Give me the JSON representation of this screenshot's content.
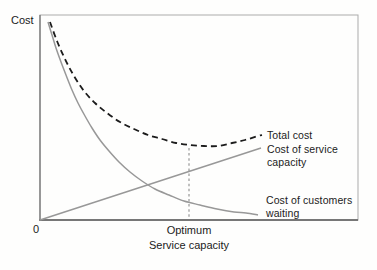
{
  "chart_data": {
    "type": "line",
    "title": "",
    "xlabel": "Service capacity",
    "ylabel": "Cost",
    "origin_tick_label": "0",
    "optimum_tick_label": "Optimum",
    "grid": false,
    "legend_position": "inline-right-labels",
    "note": "Conceptual queuing-cost diagram; no numeric scale shown. Points are in figure pixel coordinates.",
    "frame_px": {
      "x0": 40,
      "y0": 15,
      "x1": 358,
      "y1": 220
    },
    "colors": {
      "frame": "#ababab",
      "axis": "#777777",
      "solid_curve": "#989898",
      "dashed_curve": "#1c1c1c",
      "optimum_line": "#8d8d8d",
      "text": "#1b1b1b"
    },
    "series": [
      {
        "name": "Total cost",
        "style": "dashed",
        "color": "#1c1c1c",
        "width": 1.8,
        "dash": "6 4",
        "points": [
          [
            50,
            22
          ],
          [
            57,
            41
          ],
          [
            65,
            59
          ],
          [
            74,
            76
          ],
          [
            84,
            91
          ],
          [
            95,
            103
          ],
          [
            107,
            113
          ],
          [
            120,
            122
          ],
          [
            134,
            129
          ],
          [
            148,
            135
          ],
          [
            162,
            139
          ],
          [
            176,
            143
          ],
          [
            190,
            145
          ],
          [
            204,
            146
          ],
          [
            218,
            146
          ],
          [
            232,
            143
          ],
          [
            245,
            140
          ],
          [
            258,
            136
          ],
          [
            262,
            135
          ]
        ]
      },
      {
        "name": "Cost of service capacity",
        "style": "solid",
        "color": "#989898",
        "width": 1.5,
        "dash": "",
        "points": [
          [
            40,
            220
          ],
          [
            261,
            148
          ]
        ]
      },
      {
        "name": "Cost of customers waiting",
        "style": "solid",
        "color": "#989898",
        "width": 1.5,
        "dash": "",
        "points": [
          [
            48,
            22
          ],
          [
            52,
            35
          ],
          [
            56,
            48
          ],
          [
            61,
            62
          ],
          [
            66,
            75
          ],
          [
            72,
            90
          ],
          [
            78,
            103
          ],
          [
            85,
            116
          ],
          [
            92,
            128
          ],
          [
            100,
            140
          ],
          [
            109,
            151
          ],
          [
            119,
            162
          ],
          [
            130,
            172
          ],
          [
            142,
            181
          ],
          [
            155,
            189
          ],
          [
            169,
            195
          ],
          [
            184,
            201
          ],
          [
            200,
            205
          ],
          [
            217,
            209
          ],
          [
            234,
            212
          ],
          [
            246,
            213
          ],
          [
            258,
            215
          ]
        ]
      }
    ],
    "optimum_line": {
      "x": 189,
      "y_top": 148,
      "y_bottom": 219,
      "dash": "2.5 2.6",
      "width": 1.1
    },
    "labels": {
      "y_axis": "Cost",
      "origin": "0",
      "optimum": "Optimum",
      "x_axis": "Service capacity",
      "total": "Total cost",
      "service": "Cost of service capacity",
      "waiting": "Cost of customers waiting"
    }
  }
}
